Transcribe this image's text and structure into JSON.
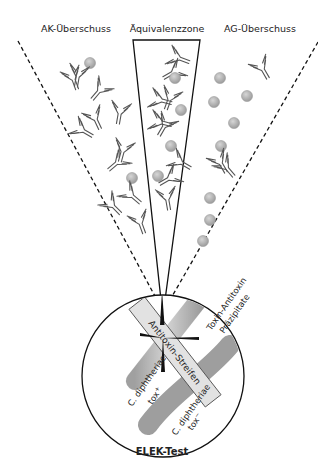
{
  "diagram": {
    "zones": {
      "ak_excess": "AK-Überschuss",
      "equivalence": "Äquivalenzzone",
      "ag_excess": "AG-Überschuss"
    },
    "petri": {
      "strip_label": "Antitoxin-Streifen",
      "precipitate_label_line1": "Toxin-Antitoxin",
      "precipitate_label_line2": "Präzipitate",
      "strain_pos_line1": "C. diphtheriae",
      "strain_pos_line2": "tox",
      "strain_pos_sup": "+",
      "strain_neg_line1": "C. diphtheriae",
      "strain_neg_line2": "tox",
      "strain_neg_sup": "−",
      "caption": "ELEK-Test"
    },
    "colors": {
      "antigen": "#a8a8a8",
      "strip": "#e0e0e0",
      "tox_positive_bar": "#cfcfcf",
      "tox_negative_bar": "#9e9e9e",
      "lines": "#111111"
    }
  }
}
